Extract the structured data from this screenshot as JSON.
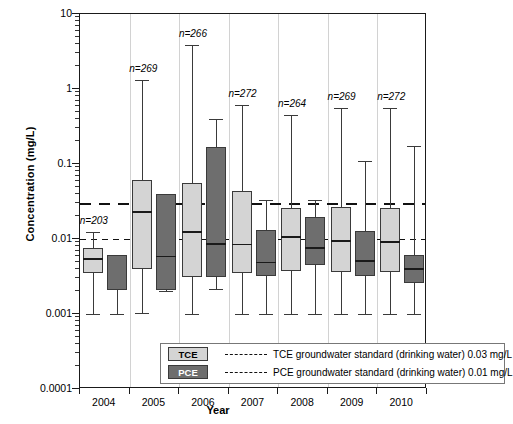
{
  "chart_data": {
    "type": "box",
    "title": "",
    "xlabel": "Year",
    "ylabel": "Concentration (mg/L)",
    "ylim": [
      0.0001,
      10
    ],
    "yscale": "log",
    "ytick_labels": [
      "10",
      "1",
      "0.1",
      "0.01",
      "0.001",
      "0.0001"
    ],
    "ytick_values": [
      10,
      1,
      0.1,
      0.01,
      0.001,
      0.0001
    ],
    "grid": false,
    "legend_position": "inside-bottom-left",
    "categories": [
      "2004",
      "2005",
      "2006",
      "2007",
      "2008",
      "2009",
      "2010"
    ],
    "series": [
      {
        "name": "TCE",
        "color": "#d4d4d4",
        "boxes": [
          {
            "year": "2004",
            "lower_whisker": 0.001,
            "q1": 0.0035,
            "median": 0.0055,
            "q3": 0.0076,
            "upper_whisker": 0.0125,
            "n": 203
          },
          {
            "year": "2005",
            "lower_whisker": 0.00102,
            "q1": 0.004,
            "median": 0.0235,
            "q3": 0.062,
            "upper_whisker": 1.3,
            "n": 269
          },
          {
            "year": "2006",
            "lower_whisker": 0.001,
            "q1": 0.0031,
            "median": 0.0128,
            "q3": 0.055,
            "upper_whisker": 3.85,
            "n": 266
          },
          {
            "year": "2007",
            "lower_whisker": 0.001,
            "q1": 0.0035,
            "median": 0.0087,
            "q3": 0.044,
            "upper_whisker": 0.62,
            "n": 272
          },
          {
            "year": "2008",
            "lower_whisker": 0.001,
            "q1": 0.0038,
            "median": 0.0108,
            "q3": 0.026,
            "upper_whisker": 0.45,
            "n": 264
          },
          {
            "year": "2009",
            "lower_whisker": 0.001,
            "q1": 0.0036,
            "median": 0.0097,
            "q3": 0.0265,
            "upper_whisker": 0.56,
            "n": 269
          },
          {
            "year": "2010",
            "lower_whisker": 0.001,
            "q1": 0.0036,
            "median": 0.0094,
            "q3": 0.0262,
            "upper_whisker": 0.56,
            "n": 272
          }
        ]
      },
      {
        "name": "PCE",
        "color": "#6e6e6e",
        "boxes": [
          {
            "year": "2004",
            "lower_whisker": 0.001,
            "q1": 0.0021,
            "median": null,
            "q3": 0.0062,
            "upper_whisker": null,
            "n": null
          },
          {
            "year": "2005",
            "lower_whisker": 0.002,
            "q1": 0.0021,
            "median": 0.006,
            "q3": 0.0395,
            "upper_whisker": 0.0395,
            "n": null
          },
          {
            "year": "2006",
            "lower_whisker": 0.00215,
            "q1": 0.0031,
            "median": 0.0088,
            "q3": 0.166,
            "upper_whisker": 0.4,
            "n": null
          },
          {
            "year": "2007",
            "lower_whisker": 0.001,
            "q1": 0.0032,
            "median": 0.005,
            "q3": 0.0131,
            "upper_whisker": 0.0335,
            "n": null
          },
          {
            "year": "2008",
            "lower_whisker": 0.001,
            "q1": 0.0045,
            "median": 0.0078,
            "q3": 0.0195,
            "upper_whisker": 0.0335,
            "n": null
          },
          {
            "year": "2009",
            "lower_whisker": 0.001,
            "q1": 0.0032,
            "median": 0.0052,
            "q3": 0.0128,
            "upper_whisker": 0.111,
            "n": null
          },
          {
            "year": "2010",
            "lower_whisker": 0.001,
            "q1": 0.0026,
            "median": 0.0041,
            "q3": 0.0062,
            "upper_whisker": 0.175,
            "n": null
          }
        ]
      }
    ],
    "reference_lines": [
      {
        "id": "tce-standard",
        "label": "TCE groundwater standard (drinking water) 0.03 mg/L",
        "value": 0.03,
        "style": "dashed-long"
      },
      {
        "id": "pce-standard",
        "label": "PCE groundwater standard (drinking water) 0.01 mg/L",
        "value": 0.01,
        "style": "dashed-short"
      }
    ],
    "annotations": [
      {
        "text": "n=203",
        "year": "2004"
      },
      {
        "text": "n=269",
        "year": "2005"
      },
      {
        "text": "n=266",
        "year": "2006"
      },
      {
        "text": "n=272",
        "year": "2007"
      },
      {
        "text": "n=264",
        "year": "2008"
      },
      {
        "text": "n=269",
        "year": "2009"
      },
      {
        "text": "n=272",
        "year": "2010"
      }
    ]
  },
  "legend": {
    "tce_swatch_label": "TCE",
    "pce_swatch_label": "PCE",
    "tce_text": "TCE groundwater standard (drinking water) 0.03 mg/L",
    "pce_text": "PCE groundwater standard (drinking water) 0.01 mg/L"
  },
  "axes": {
    "y_title": "Concentration (mg/L)",
    "x_title": "Year"
  }
}
